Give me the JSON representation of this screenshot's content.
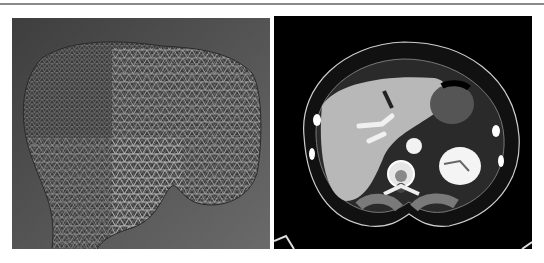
{
  "figure": {
    "panels": [
      {
        "id": "left",
        "content": "3D triangular wireframe surface mesh of proximal bone (femur/humerus head)",
        "background_color": "#5a5a5a",
        "mesh_color": "#d8d8d8"
      },
      {
        "id": "right",
        "content": "Axial abdominal CT slice showing liver, spine, kidney, stomach",
        "background_color": "#000000",
        "tissue_color": "#bfbfbf"
      }
    ],
    "top_rule_color": "#8a8a8a"
  }
}
